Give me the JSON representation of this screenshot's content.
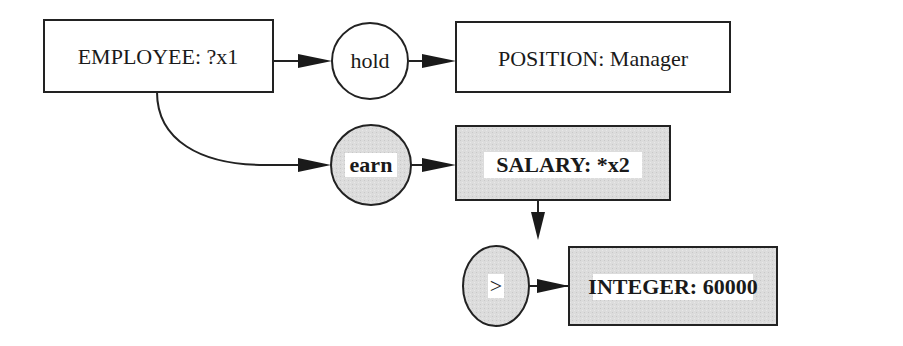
{
  "diagram": {
    "type": "conceptual-graph",
    "colors": {
      "plain_fill": "#ffffff",
      "shaded_fill": "#d9d9d9",
      "stroke": "#222222",
      "text": "#1a1a1a"
    },
    "nodes": {
      "employee": {
        "label": "EMPLOYEE: ?x1",
        "shape": "box",
        "shaded": false
      },
      "hold": {
        "label": "hold",
        "shape": "circle",
        "shaded": false
      },
      "position": {
        "label": "POSITION: Manager",
        "shape": "box",
        "shaded": false
      },
      "earn": {
        "label": "earn",
        "shape": "circle",
        "shaded": true
      },
      "salary": {
        "label": "SALARY: *x2",
        "shape": "box",
        "shaded": true
      },
      "greater": {
        "label": ">",
        "shape": "circle",
        "shaded": true
      },
      "integer": {
        "label": "INTEGER: 60000",
        "shape": "box",
        "shaded": true
      }
    },
    "edges": [
      {
        "from": "employee",
        "to": "hold"
      },
      {
        "from": "hold",
        "to": "position"
      },
      {
        "from": "employee",
        "to": "earn"
      },
      {
        "from": "earn",
        "to": "salary"
      },
      {
        "from": "salary",
        "to": "greater"
      },
      {
        "from": "greater",
        "to": "integer"
      }
    ]
  }
}
